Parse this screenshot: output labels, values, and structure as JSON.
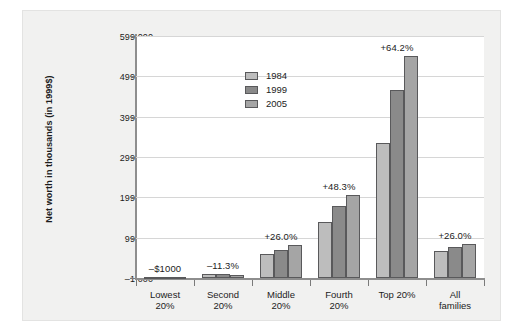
{
  "chart_data": {
    "type": "bar",
    "title": "",
    "xlabel": "",
    "ylabel": "Net worth in thousands (in 1999$)",
    "ylim": [
      -1000,
      599000
    ],
    "yticks": [
      -1000,
      99000,
      199000,
      299000,
      399000,
      499000,
      599000
    ],
    "ytick_labels": [
      "–1 000",
      "99 000",
      "199 000",
      "299 000",
      "399 000",
      "499 000",
      "599 000"
    ],
    "grid": true,
    "legend_position": "upper center",
    "categories": [
      "Lowest 20%",
      "Second 20%",
      "Middle 20%",
      "Fourth 20%",
      "Top 20%",
      "All families"
    ],
    "category_lines": [
      [
        "Lowest",
        "20%"
      ],
      [
        "Second",
        "20%"
      ],
      [
        "Middle",
        "20%"
      ],
      [
        "Fourth",
        "20%"
      ],
      [
        "Top 20%",
        ""
      ],
      [
        "All",
        "families"
      ]
    ],
    "series": [
      {
        "name": "1984",
        "color": "#bdbdbd",
        "values": [
          1000,
          8500,
          59000,
          139000,
          334000,
          66000
        ]
      },
      {
        "name": "1999",
        "color": "#8a8a8a",
        "values": [
          900,
          8000,
          68000,
          178000,
          466000,
          76000
        ]
      },
      {
        "name": "2005",
        "color": "#a5a5a5",
        "values": [
          800,
          7500,
          80000,
          205000,
          549000,
          83000
        ]
      }
    ],
    "annotations": [
      {
        "category": "Lowest 20%",
        "text": "–$1000"
      },
      {
        "category": "Second 20%",
        "text": "–11.3%"
      },
      {
        "category": "Middle 20%",
        "text": "+26.0%"
      },
      {
        "category": "Fourth 20%",
        "text": "+48.3%"
      },
      {
        "category": "Top 20%",
        "text": "+64.2%"
      },
      {
        "category": "All families",
        "text": "+26.0%"
      }
    ],
    "colors": {
      "background": "#f1f1f0",
      "plot_background": "#ffffff",
      "axis": "#8e8e8e",
      "grid": "#d6d6d6",
      "text": "#1c1c1c",
      "bar_edge": "#59595b"
    }
  }
}
